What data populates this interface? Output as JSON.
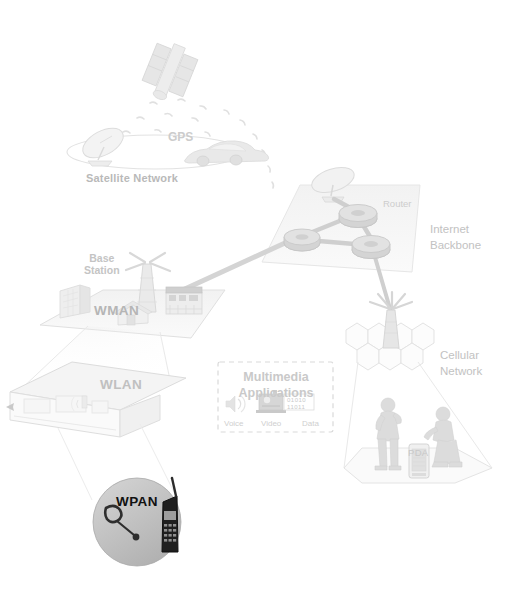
{
  "diagram": {
    "background_color": "#ffffff",
    "palette": {
      "plane_fill": "#f6f6f6",
      "plane_stroke": "#dcdcdc",
      "link_line": "#d2d2d2",
      "cone_line": "#e6e6e6",
      "label_gray": "#c2c2c2",
      "label_dark": "#111111",
      "wpan_circle_fill": "#bdbdbd",
      "router_fill": "#d8d8d8",
      "hex_stroke": "#e0e0e0"
    }
  },
  "labels": {
    "satellite_network": "Satellite Network",
    "gps": "GPS",
    "base_station": "Base\nStation",
    "wman": "WMAN",
    "wlan": "WLAN",
    "wpan": "WPAN",
    "router": "Router",
    "internet_backbone": "Internet\nBackbone",
    "cellular_network": "Cellular\nNetwork",
    "pda": "PDA"
  },
  "multimedia_panel": {
    "title": "Multimedia\nApplications",
    "items": [
      {
        "name": "voice",
        "label": "Voice",
        "icon": "speaker-icon"
      },
      {
        "name": "video",
        "label": "Video",
        "icon": "video-camera-icon"
      },
      {
        "name": "data",
        "label": "Data",
        "icon": "binary-data-icon"
      }
    ],
    "binary_line_1": "01010",
    "binary_line_2": "11011",
    "border_style": "dashed"
  },
  "nodes": [
    {
      "id": "satellite",
      "name": "gps-satellite",
      "label": ""
    },
    {
      "id": "satellite-dish",
      "name": "satellite-dish",
      "label": ""
    },
    {
      "id": "car",
      "name": "car",
      "label": ""
    },
    {
      "id": "satellite-plane",
      "name": "satellite-network-plane",
      "label": "Satellite Network"
    },
    {
      "id": "backbone-plane",
      "name": "internet-backbone-plane",
      "label": "Internet Backbone"
    },
    {
      "id": "router-1",
      "name": "router-node-top",
      "label": "Router"
    },
    {
      "id": "router-2",
      "name": "router-node-left",
      "label": ""
    },
    {
      "id": "router-3",
      "name": "router-node-bottom",
      "label": ""
    },
    {
      "id": "backbone-dish",
      "name": "backbone-satellite-dish",
      "label": ""
    },
    {
      "id": "wman-plane",
      "name": "wman-plane",
      "label": "WMAN"
    },
    {
      "id": "base-tower",
      "name": "base-station-tower",
      "label": "Base Station"
    },
    {
      "id": "city-building",
      "name": "office-building",
      "label": ""
    },
    {
      "id": "suburban-house",
      "name": "suburban-house",
      "label": ""
    },
    {
      "id": "storefront",
      "name": "storefront-building",
      "label": ""
    },
    {
      "id": "wlan-house",
      "name": "wlan-house-cutaway",
      "label": "WLAN"
    },
    {
      "id": "wpan-circle",
      "name": "wpan-circle",
      "label": "WPAN"
    },
    {
      "id": "wpan-headset",
      "name": "bluetooth-headset",
      "label": ""
    },
    {
      "id": "wpan-phone",
      "name": "mobile-phone",
      "label": ""
    },
    {
      "id": "cell-tower",
      "name": "cellular-tower",
      "label": ""
    },
    {
      "id": "cell-hexes",
      "name": "cellular-hex-grid",
      "label": "Cellular Network"
    },
    {
      "id": "person-man",
      "name": "person-standing-man",
      "label": ""
    },
    {
      "id": "person-woman",
      "name": "person-sitting-woman",
      "label": ""
    },
    {
      "id": "pda-device",
      "name": "pda-device",
      "label": "PDA"
    }
  ],
  "links": [
    {
      "from": "base-tower",
      "to": "router-2",
      "name": "link-wman-to-backbone",
      "style": "thick-gray"
    },
    {
      "from": "router-1",
      "to": "router-2",
      "name": "link-router1-router2",
      "style": "thick-gray"
    },
    {
      "from": "router-1",
      "to": "router-3",
      "name": "link-router1-router3",
      "style": "thick-gray"
    },
    {
      "from": "router-2",
      "to": "router-3",
      "name": "link-router2-router3",
      "style": "thick-gray"
    },
    {
      "from": "router-1",
      "to": "backbone-dish",
      "name": "link-router1-dish",
      "style": "thick-gray"
    },
    {
      "from": "router-3",
      "to": "cell-tower",
      "name": "link-backbone-cellular",
      "style": "thick-gray"
    },
    {
      "from": "satellite",
      "to": "car",
      "name": "gps-signal-arc",
      "style": "dotted-arc"
    },
    {
      "from": "wman-plane",
      "to": "wlan-house",
      "name": "cone-wman-wlan",
      "style": "cone"
    },
    {
      "from": "wlan-house",
      "to": "wpan-circle",
      "name": "cone-wlan-wpan",
      "style": "cone"
    },
    {
      "from": "cell-hexes",
      "to": "pda-device",
      "name": "cone-cellular-pda",
      "style": "cone"
    }
  ]
}
